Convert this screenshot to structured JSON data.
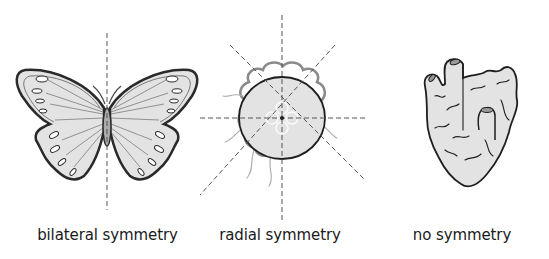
{
  "diagram": {
    "panels": [
      {
        "id": "bilateral",
        "label": "bilateral symmetry",
        "figure": "butterfly"
      },
      {
        "id": "radial",
        "label": "radial symmetry",
        "figure": "jellyfish"
      },
      {
        "id": "none",
        "label": "no symmetry",
        "figure": "sponge"
      }
    ],
    "colors": {
      "fill": "#e3e3e3",
      "outline": "#2a2a2a",
      "axis": "#555555",
      "tentacle": "#8a8a8a"
    }
  }
}
